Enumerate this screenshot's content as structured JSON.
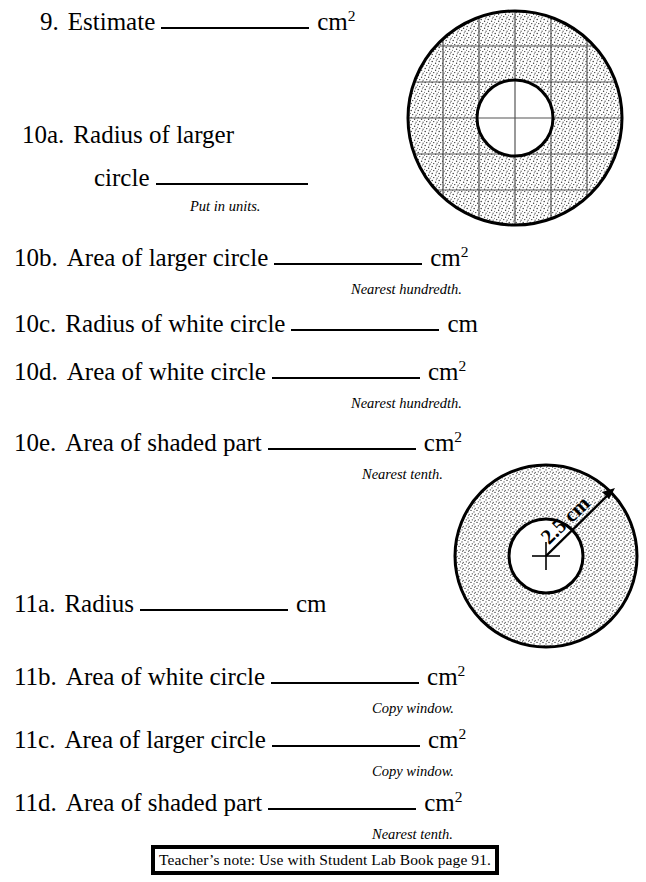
{
  "page": {
    "width": 646,
    "height": 882,
    "background": "#ffffff",
    "ink": "#000000",
    "stipple_color": "#3a3a3a",
    "grid_color": "#555555"
  },
  "questions": [
    {
      "id": "q9",
      "number": "9.",
      "text": "Estimate",
      "blank_width": 148,
      "unit": "cm",
      "exponent": "2",
      "note": null
    },
    {
      "id": "q10a",
      "number": "10a.",
      "text": "Radius of larger",
      "text_line2": "circle",
      "blank_width": 152,
      "unit": null,
      "exponent": null,
      "note": "Put in units."
    },
    {
      "id": "q10b",
      "number": "10b.",
      "text": "Area of larger circle",
      "blank_width": 148,
      "unit": "cm",
      "exponent": "2",
      "note": "Nearest hundredth."
    },
    {
      "id": "q10c",
      "number": "10c.",
      "text": "Radius of white circle",
      "blank_width": 148,
      "unit": "cm",
      "exponent": null,
      "note": null
    },
    {
      "id": "q10d",
      "number": "10d.",
      "text": "Area of white circle",
      "blank_width": 148,
      "unit": "cm",
      "exponent": "2",
      "note": "Nearest hundredth."
    },
    {
      "id": "q10e",
      "number": "10e.",
      "text": "Area of shaded part",
      "blank_width": 148,
      "unit": "cm",
      "exponent": "2",
      "note": "Nearest tenth."
    },
    {
      "id": "q11a",
      "number": "11a.",
      "text": "Radius",
      "blank_width": 148,
      "unit": "cm",
      "exponent": null,
      "note": null
    },
    {
      "id": "q11b",
      "number": "11b.",
      "text": "Area of white circle",
      "blank_width": 148,
      "unit": "cm",
      "exponent": "2",
      "note": "Copy window."
    },
    {
      "id": "q11c",
      "number": "11c.",
      "text": "Area of larger circle",
      "blank_width": 148,
      "unit": "cm",
      "exponent": "2",
      "note": "Copy window."
    },
    {
      "id": "q11d",
      "number": "11d.",
      "text": "Area of shaded part",
      "blank_width": 148,
      "unit": "cm",
      "exponent": "2",
      "note": "Nearest tenth."
    }
  ],
  "diagrams": {
    "gridded_annulus": {
      "name": "gridded-annulus-diagram",
      "description": "Shaded annulus overlaid with a square grid",
      "outer_radius_px": 108,
      "inner_radius_px": 38,
      "grid_cells_across": 6,
      "grid_spacing_px": 36,
      "shaded": true,
      "label": null
    },
    "labelled_annulus": {
      "name": "labelled-annulus-diagram",
      "description": "Shaded annulus with radius arrow from centre to outer edge",
      "outer_radius_px": 92,
      "inner_radius_px": 37,
      "shaded": true,
      "radius_label": "2.5 cm",
      "has_center_cross": true
    }
  },
  "footer": {
    "teacher_note": "Teacher’s note:  Use with Student Lab Book page 91."
  }
}
